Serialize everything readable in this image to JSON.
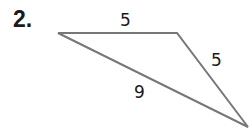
{
  "problem_number": "2.",
  "triangle": {
    "vertices": [
      [
        58,
        33
      ],
      [
        177,
        33
      ],
      [
        248,
        127
      ]
    ],
    "stroke_color": "#777777",
    "sides": [
      {
        "label": "5",
        "between": "top-left to top-right"
      },
      {
        "label": "5",
        "between": "top-right to bottom-right"
      },
      {
        "label": "9",
        "between": "top-left to bottom-right"
      }
    ]
  }
}
